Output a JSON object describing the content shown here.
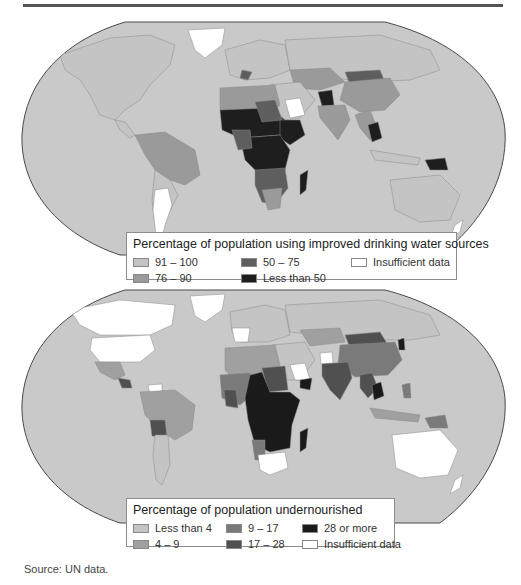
{
  "page": {
    "source": "Source: UN data."
  },
  "maps": [
    {
      "id": "water",
      "legend": {
        "title": "Percentage of population using improved drinking water sources",
        "items": [
          {
            "label": "91 – 100",
            "color": "#c4c4c4"
          },
          {
            "label": "76 – 90",
            "color": "#9a9a9a"
          },
          {
            "label": "50 – 75",
            "color": "#5e5e5e"
          },
          {
            "label": "Less than 50",
            "color": "#1e1e1e"
          },
          {
            "label": "Insufficient data",
            "color": "#ffffff"
          }
        ]
      }
    },
    {
      "id": "undernourished",
      "legend": {
        "title": "Percentage of population undernourished",
        "items": [
          {
            "label": "Less than 4",
            "color": "#c4c4c4"
          },
          {
            "label": "4 – 9",
            "color": "#a0a0a0"
          },
          {
            "label": "9 – 17",
            "color": "#7a7a7a"
          },
          {
            "label": "17 – 28",
            "color": "#505050"
          },
          {
            "label": "28 or more",
            "color": "#1a1a1a"
          },
          {
            "label": "Insufficient data",
            "color": "#ffffff"
          }
        ]
      }
    }
  ],
  "colors": {
    "ocean": "#c9c9c9",
    "land_default": "#c4c4c4",
    "border": "#8a8a8a",
    "outline": "#4a4a4a"
  }
}
